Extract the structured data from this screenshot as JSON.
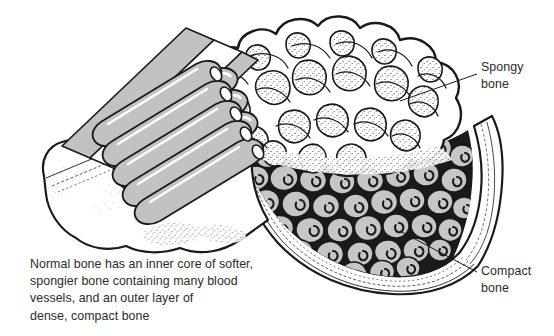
{
  "figure": {
    "background_color": "#ffffff",
    "ink_color": "#1a1a1a",
    "text_color": "#2b2b2b",
    "osteon_fill": "#c6c6c6",
    "tube_fill": "#c2c2c2",
    "marrow_fill": "#1a1a1a"
  },
  "callouts": [
    {
      "name": "spongy-bone",
      "line1": "Spongy",
      "line2": "bone",
      "leader": {
        "x1": 477,
        "y1": 74,
        "x2": 400,
        "y2": 101
      }
    },
    {
      "name": "compact-bone",
      "line1": "Compact",
      "line2": "bone",
      "leader": {
        "x1": 477,
        "y1": 272,
        "x2": 400,
        "y2": 231
      }
    }
  ],
  "caption": {
    "lines": [
      "Normal bone has an inner core of softer,",
      "spongier bone containing many blood",
      "vessels, and an outer layer of",
      "dense, compact bone"
    ]
  }
}
